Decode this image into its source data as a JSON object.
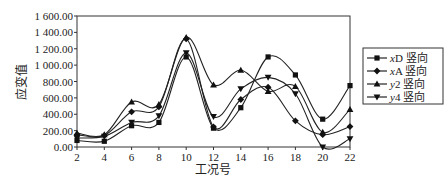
{
  "chart_data": {
    "type": "line",
    "title": "",
    "xlabel": "工况号",
    "ylabel": "应变值",
    "x": [
      2,
      4,
      6,
      8,
      10,
      12,
      14,
      16,
      18,
      20,
      22
    ],
    "xticks": [
      "2",
      "4",
      "6",
      "8",
      "10",
      "12",
      "14",
      "16",
      "18",
      "20",
      "22"
    ],
    "yticks": [
      "0.00",
      "200.00",
      "400.00",
      "600.00",
      "800.00",
      "1 000.00",
      "1 200.00",
      "1 400.00",
      "1 600.00"
    ],
    "ylim": [
      0,
      1600
    ],
    "xlim": [
      2,
      22
    ],
    "grid": false,
    "legend_position": "right",
    "series": [
      {
        "name": "xD 竖向",
        "marker": "square",
        "values": [
          80,
          70,
          260,
          300,
          1100,
          230,
          480,
          1100,
          880,
          340,
          750
        ]
      },
      {
        "name": "xA 竖向",
        "marker": "diamond",
        "values": [
          150,
          140,
          430,
          490,
          1320,
          245,
          580,
          730,
          320,
          150,
          250
        ]
      },
      {
        "name": "y2 竖向",
        "marker": "triangle",
        "values": [
          170,
          150,
          550,
          520,
          1340,
          760,
          940,
          680,
          740,
          180,
          460
        ]
      },
      {
        "name": "y4 竖向",
        "marker": "triangle-down",
        "values": [
          110,
          130,
          300,
          380,
          1150,
          370,
          710,
          850,
          650,
          0,
          100
        ]
      }
    ]
  }
}
